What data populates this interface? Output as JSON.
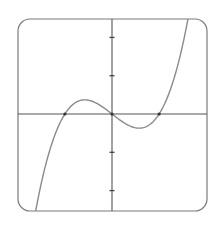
{
  "chart_data": {
    "type": "line",
    "title": "",
    "xlabel": "",
    "ylabel": "",
    "grid": false,
    "legend": null,
    "xlim": [
      -2.46,
      2.48
    ],
    "ylim": [
      -2.53,
      2.48
    ],
    "y_ticks": [
      -2,
      -1,
      1,
      2
    ],
    "x_ticks": [],
    "roots": [
      -1.23,
      0,
      1.23
    ],
    "local_max": {
      "x": -0.71,
      "y": 0.37
    },
    "local_min": {
      "x": 0.71,
      "y": -0.37
    },
    "series": [
      {
        "name": "f(x)",
        "color": "#8a8a8a",
        "x": [
          -2.0,
          -1.8,
          -1.6,
          -1.4,
          -1.23,
          -1.0,
          -0.8,
          -0.71,
          -0.6,
          -0.4,
          -0.2,
          0.0,
          0.2,
          0.4,
          0.6,
          0.71,
          0.8,
          1.0,
          1.23,
          1.4,
          1.6,
          1.8,
          1.98
        ],
        "y": [
          -2.58,
          -1.61,
          -0.86,
          -0.32,
          0.0,
          0.27,
          0.37,
          0.37,
          0.36,
          0.28,
          0.15,
          0.0,
          -0.15,
          -0.28,
          -0.36,
          -0.37,
          -0.37,
          -0.27,
          0.0,
          0.32,
          0.86,
          1.61,
          2.48
        ]
      }
    ],
    "marked_points": [
      {
        "x": -1.23,
        "y": 0
      },
      {
        "x": 0,
        "y": 0
      },
      {
        "x": 1.23,
        "y": 0
      }
    ]
  },
  "colors": {
    "frame": "#7a7a7a",
    "axes": "#555555",
    "curve": "#8a8a8a",
    "ticks": "#444444",
    "points": "#333333",
    "background": "#ffffff"
  }
}
